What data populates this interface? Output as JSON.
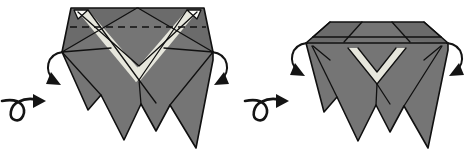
{
  "figure": {
    "kind": "origami-fold-diagram",
    "background_color": "#ffffff",
    "ink_color": "#101010",
    "step_count": 2
  },
  "palette": {
    "paper_front": "#757575",
    "paper_shade": "#6b6b6b",
    "paper_light": "#e6e6dc",
    "paper_white": "#fbfbf7",
    "line": "#101010"
  },
  "panels": [
    {
      "id": "panel-before",
      "label": "before",
      "model_name": "pointed-hexagonal-base-with-three-legs",
      "top_shape": "peaked",
      "crease_line": {
        "name": "horizontal-valley-crease",
        "style": "dashed",
        "orientation": "horizontal"
      },
      "light_marking": "V-chevron-band",
      "leg_count": 3,
      "arrows": [
        {
          "name": "fold-flap-down-left-arrow",
          "direction": "down-right",
          "side": "left"
        },
        {
          "name": "fold-flap-down-right-arrow",
          "direction": "down-left",
          "side": "right"
        }
      ]
    },
    {
      "id": "panel-after",
      "label": "after",
      "model_name": "flat-topped-base-with-three-legs",
      "top_shape": "flattened-band",
      "crease_line": null,
      "light_marking": "V-chevron-notch",
      "leg_count": 3,
      "arrows": [
        {
          "name": "fold-flap-down-left-arrow",
          "direction": "down-right",
          "side": "left"
        },
        {
          "name": "fold-flap-down-right-arrow",
          "direction": "down-left",
          "side": "right"
        }
      ]
    }
  ],
  "turn_over_arrows": [
    {
      "name": "turn-over-loop-arrow-first",
      "meaning": "turn the model over",
      "direction": "right",
      "style": "looped"
    },
    {
      "name": "turn-over-loop-arrow-second",
      "meaning": "turn the model over",
      "direction": "right",
      "style": "looped"
    }
  ]
}
